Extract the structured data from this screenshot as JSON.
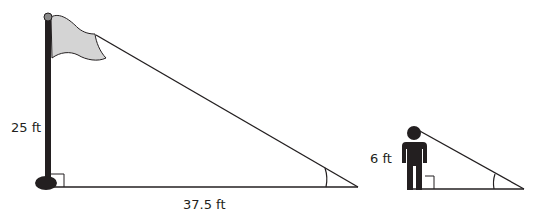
{
  "diagram": {
    "type": "similar-triangles-shadow",
    "flagpole": {
      "height_label": "25 ft",
      "shadow_label": "37.5 ft",
      "pole_color": "#231f20",
      "flag_color": "#d4d4d4"
    },
    "person": {
      "height_label": "6 ft",
      "color": "#231f20"
    },
    "line_color": "#231f20"
  }
}
